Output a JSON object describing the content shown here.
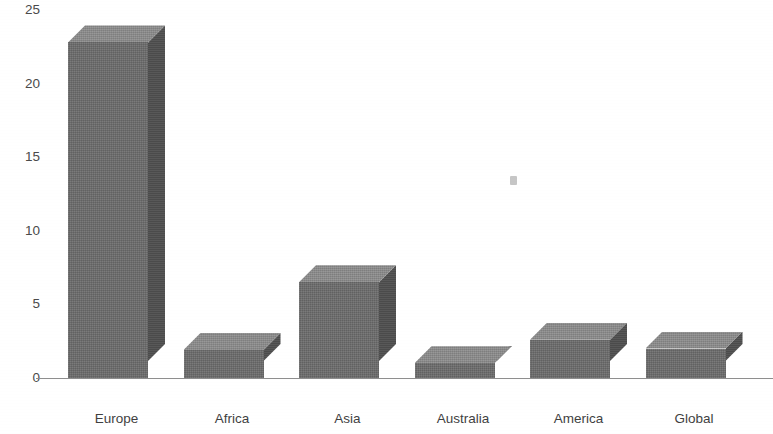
{
  "chart_data": {
    "type": "bar",
    "title": "",
    "subtitle": "",
    "xlabel": "",
    "ylabel": "",
    "categories": [
      "Europe",
      "Africa",
      "Asia",
      "Australia",
      "America",
      "Global"
    ],
    "values": [
      22.8,
      1.9,
      6.5,
      1.0,
      2.6,
      2.0
    ],
    "series": [
      {
        "name": "",
        "values": [
          22.8,
          1.9,
          6.5,
          1.0,
          2.6,
          2.0
        ]
      }
    ],
    "ylim": [
      0,
      25
    ],
    "yticks": [
      0,
      5,
      10,
      15,
      20,
      25
    ],
    "ytick_labels": [
      "0",
      "5",
      "10",
      "15",
      "20",
      "25"
    ],
    "xtick_labels": [
      "Europe",
      "Africa",
      "Asia",
      "Australia",
      "America",
      "Global"
    ],
    "grid": false,
    "legend": null,
    "legend_position": "none",
    "annotations": [],
    "style": {
      "bar_front_color": "#6b6b6b",
      "bar_top_color": "#8a8a8a",
      "bar_side_color": "#4f4f4f",
      "axis_color": "#8e8e8e",
      "text_color": "#3f3f3f",
      "background": "#ffffff",
      "three_d": true
    }
  },
  "axis": {
    "y_ticks": [
      {
        "label": "25",
        "value": 25
      },
      {
        "label": "20",
        "value": 20
      },
      {
        "label": "15",
        "value": 15
      },
      {
        "label": "10",
        "value": 10
      },
      {
        "label": "5",
        "value": 5
      },
      {
        "label": "0",
        "value": 0
      }
    ],
    "x_ticks": [
      {
        "label": "Europe"
      },
      {
        "label": "Africa"
      },
      {
        "label": "Asia"
      },
      {
        "label": "Australia"
      },
      {
        "label": "America"
      },
      {
        "label": "Global"
      }
    ]
  }
}
